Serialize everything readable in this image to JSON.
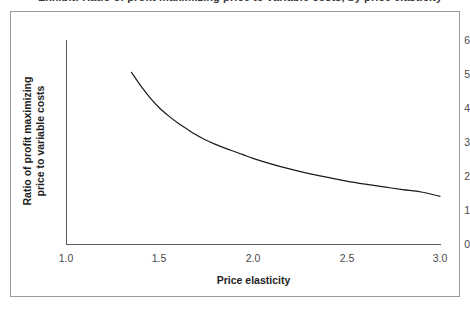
{
  "caption": {
    "text": "Exhibit: Ratio of profit maximizing price to variable costs, by price elasticity"
  },
  "chart_data": {
    "type": "line",
    "title": "",
    "xlabel": "Price elasticity",
    "ylabel": "Ratio of profit maximizing price to variable costs",
    "xlim": [
      1.0,
      3.0
    ],
    "ylim": [
      0,
      6
    ],
    "xticks": [
      "1.0",
      "1.5",
      "2.0",
      "2.5",
      "3.0"
    ],
    "xtick_values": [
      1.0,
      1.5,
      2.0,
      2.5,
      3.0
    ],
    "yticks": [
      "0",
      "1",
      "2",
      "3",
      "4",
      "5",
      "6"
    ],
    "ytick_values": [
      0,
      1,
      2,
      3,
      4,
      5,
      6
    ],
    "grid": false,
    "legend": null,
    "line_color": "#1a1a1a",
    "series": [
      {
        "name": "Ratio of profit maximizing price to variable costs",
        "x": [
          1.35,
          1.4,
          1.45,
          1.5,
          1.55,
          1.6,
          1.65,
          1.7,
          1.75,
          1.8,
          1.85,
          1.9,
          1.95,
          2.0,
          2.1,
          2.2,
          2.3,
          2.4,
          2.5,
          2.6,
          2.7,
          2.8,
          2.9,
          3.0
        ],
        "y": [
          5.05,
          4.65,
          4.3,
          4.0,
          3.76,
          3.55,
          3.37,
          3.2,
          3.05,
          2.93,
          2.82,
          2.72,
          2.62,
          2.52,
          2.35,
          2.2,
          2.07,
          1.96,
          1.85,
          1.76,
          1.68,
          1.6,
          1.53,
          1.4
        ]
      }
    ]
  },
  "axes": {
    "y_title": "Ratio of profit maximizing\nprice to variable costs",
    "y_title_line1": "Ratio of profit maximizing",
    "y_title_line2": "price to variable costs",
    "x_title": "Price elasticity"
  }
}
